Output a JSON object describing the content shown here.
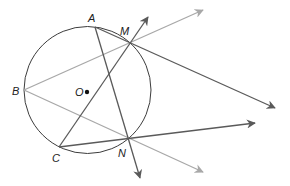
{
  "diagram": {
    "title": "",
    "circle": {
      "center_label": "O",
      "cx": 87.5,
      "cy": 90,
      "r": 63.5
    },
    "points": {
      "A": {
        "label": "A",
        "x": 95,
        "y": 27
      },
      "M": {
        "label": "M",
        "x": 130,
        "y": 43
      },
      "B": {
        "label": "B",
        "x": 24,
        "y": 90
      },
      "C": {
        "label": "C",
        "x": 59,
        "y": 147
      },
      "N": {
        "label": "N",
        "x": 129,
        "y": 139
      },
      "O": {
        "label": "O",
        "x": 87,
        "y": 92
      }
    },
    "rays": [
      {
        "name": "ray-CM",
        "from": "C",
        "through": "M",
        "tip": [
          148,
          17
        ],
        "color": "#5a5a5a"
      },
      {
        "name": "ray-AN",
        "from": "A",
        "through": "N",
        "tip": [
          140,
          178
        ],
        "color": "#5a5a5a"
      },
      {
        "name": "ray-AM",
        "from": "A",
        "through": "M",
        "tip": [
          275,
          108
        ],
        "color": "#5a5a5a"
      },
      {
        "name": "ray-CN",
        "from": "C",
        "through": "N",
        "tip": [
          255,
          123
        ],
        "color": "#5a5a5a"
      },
      {
        "name": "ray-BM",
        "from": "B",
        "through": "M",
        "tip": [
          203,
          10
        ],
        "color": "#a8a8a8"
      },
      {
        "name": "ray-BN",
        "from": "B",
        "through": "N",
        "tip": [
          203,
          172
        ],
        "color": "#a8a8a8"
      }
    ],
    "colors": {
      "dark_line": "#5a5a5a",
      "light_line": "#a8a8a8",
      "circle": "#3c3c3c"
    }
  }
}
